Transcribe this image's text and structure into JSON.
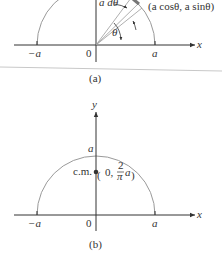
{
  "figure_a": {
    "caption": "(a)",
    "point_label": "(a cosθ, a sinθ)",
    "arc_element_label": "a dθ",
    "angle_label": "θ",
    "x_axis_label": "x",
    "ticks": {
      "neg": "−a",
      "origin": "0",
      "pos": "a"
    }
  },
  "figure_b": {
    "caption": "(b)",
    "x_axis_label": "x",
    "y_axis_label": "y",
    "top_label": "a",
    "cm_label": "c.m.",
    "cm_coord_prefix": "0,",
    "cm_frac_num": "2",
    "cm_frac_den": "π",
    "cm_frac_suffix": "a",
    "ticks": {
      "neg": "−a",
      "origin": "0",
      "pos": "a"
    }
  },
  "colors": {
    "axis": "#333333",
    "arc": "#9a9a9a",
    "dot": "#333333",
    "separator": "#c8c8c8"
  }
}
